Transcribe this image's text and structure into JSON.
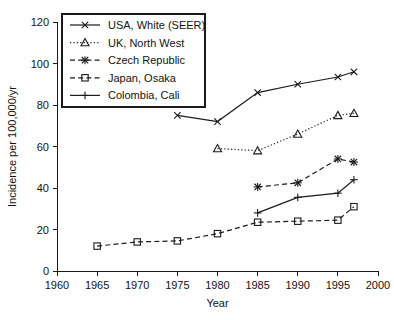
{
  "chart_data": {
    "type": "line",
    "title": "",
    "xlabel": "Year",
    "ylabel": "Incidence per 100,000/yr",
    "xlim": [
      1960,
      2000
    ],
    "ylim": [
      0,
      120
    ],
    "xticks": [
      1960,
      1965,
      1970,
      1975,
      1980,
      1985,
      1990,
      1995,
      2000
    ],
    "yticks": [
      0,
      20,
      40,
      60,
      80,
      100,
      120
    ],
    "xtick_labels": [
      "1960",
      "1965",
      "1970",
      "1975",
      "1980",
      "1985",
      "1990",
      "1995",
      "2000"
    ],
    "ytick_labels": [
      "0",
      "20",
      "40",
      "60",
      "80",
      "100",
      "120"
    ],
    "grid": false,
    "legend_position": "upper-left",
    "series": [
      {
        "name": "USA, White (SEER)",
        "marker": "x",
        "dash": "none",
        "x": [
          1975,
          1980,
          1985,
          1990,
          1995,
          1997
        ],
        "values": [
          75,
          72,
          86,
          90,
          93.5,
          96
        ]
      },
      {
        "name": "UK, North West",
        "marker": "triangle",
        "dash": "dotted",
        "x": [
          1980,
          1985,
          1990,
          1995,
          1997
        ],
        "values": [
          59,
          58,
          66,
          75,
          76
        ]
      },
      {
        "name": "Czech Republic",
        "marker": "asterisk",
        "dash": "dashed",
        "x": [
          1985,
          1990,
          1995,
          1997
        ],
        "values": [
          40.5,
          42.5,
          54,
          52.5
        ]
      },
      {
        "name": "Japan, Osaka",
        "marker": "square",
        "dash": "dashed",
        "x": [
          1965,
          1970,
          1975,
          1980,
          1985,
          1990,
          1995,
          1997
        ],
        "values": [
          12,
          14,
          14.5,
          18,
          23.5,
          24,
          24.5,
          31
        ]
      },
      {
        "name": "Colombia, Cali",
        "marker": "plus",
        "dash": "none",
        "x": [
          1985,
          1990,
          1995,
          1997
        ],
        "values": [
          28,
          35.5,
          37.5,
          44
        ]
      }
    ]
  },
  "legend": {
    "entries": [
      "USA, White (SEER)",
      "UK, North West",
      "Czech Republic",
      "Japan, Osaka",
      "Colombia, Cali"
    ]
  },
  "colors": {
    "ink": "#1a1a1a",
    "background": "#ffffff"
  }
}
